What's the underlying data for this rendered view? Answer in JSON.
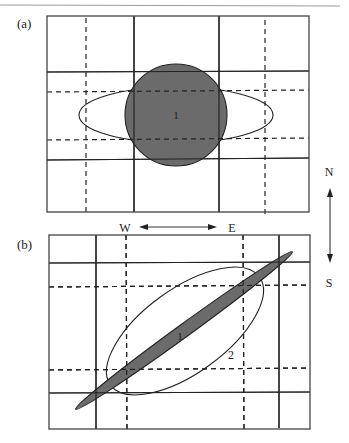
{
  "panels": [
    {
      "label": "(a)",
      "regions": [
        {
          "id": "1",
          "label": "1",
          "shape": "circle",
          "fill": "#6b6b6b"
        },
        {
          "id": "ellipse",
          "shape": "horizontal-ellipse",
          "fill": "none"
        }
      ]
    },
    {
      "label": "(b)",
      "regions": [
        {
          "id": "1",
          "label": "1",
          "shape": "thin-diagonal-ellipse",
          "fill": "#6b6b6b"
        },
        {
          "id": "2",
          "label": "2",
          "shape": "wide-diagonal-ellipse",
          "fill": "none"
        }
      ]
    }
  ],
  "compass": {
    "north": "N",
    "south": "S",
    "west": "W",
    "east": "E"
  },
  "colors": {
    "shaded_region": "#6b6b6b",
    "lines": "#222222",
    "background": "#ffffff"
  }
}
